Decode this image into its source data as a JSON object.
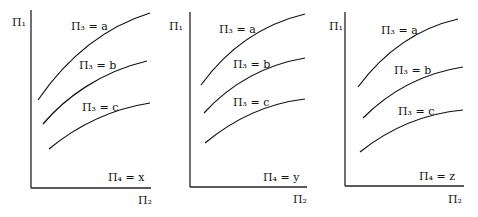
{
  "figure": {
    "panels": [
      {
        "id": "x",
        "y_axis_label": "Π₁",
        "x_axis_label": "Π₂",
        "parameter_label": "Π₄ = x",
        "curves": [
          {
            "label": "Π₃ = a"
          },
          {
            "label": "Π₃ = b"
          },
          {
            "label": "Π₃ = c"
          }
        ]
      },
      {
        "id": "y",
        "y_axis_label": "Π₁",
        "x_axis_label": "Π₂",
        "parameter_label": "Π₄ = y",
        "curves": [
          {
            "label": "Π₃ = a"
          },
          {
            "label": "Π₃ = b"
          },
          {
            "label": "Π₃ = c"
          }
        ]
      },
      {
        "id": "z",
        "y_axis_label": "Π₁",
        "x_axis_label": "Π₂",
        "parameter_label": "Π₄ = z",
        "curves": [
          {
            "label": "Π₃ = a"
          },
          {
            "label": "Π₃ = b"
          },
          {
            "label": "Π₃ = c"
          }
        ]
      }
    ]
  }
}
